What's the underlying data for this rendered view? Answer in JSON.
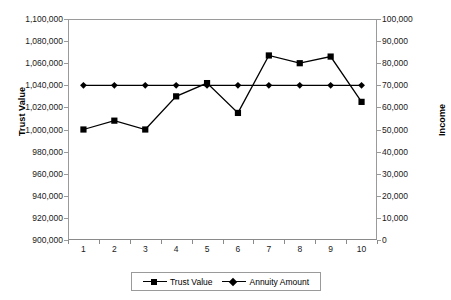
{
  "chart_data": {
    "type": "line",
    "title": "",
    "xlabel": "",
    "ylabel": "Trust Value",
    "y2label": "Income",
    "categories": [
      "1",
      "2",
      "3",
      "4",
      "5",
      "6",
      "7",
      "8",
      "9",
      "10"
    ],
    "ylim": [
      900000,
      1100000
    ],
    "ytick_step": 20000,
    "yticks": [
      "900,000",
      "920,000",
      "940,000",
      "960,000",
      "980,000",
      "1,000,000",
      "1,020,000",
      "1,040,000",
      "1,060,000",
      "1,080,000",
      "1,100,000"
    ],
    "y2lim": [
      0,
      100000
    ],
    "y2tick_step": 10000,
    "y2ticks": [
      "0",
      "10,000",
      "20,000",
      "30,000",
      "40,000",
      "50,000",
      "60,000",
      "70,000",
      "80,000",
      "90,000",
      "100,000"
    ],
    "grid": false,
    "legend_position": "bottom",
    "series": [
      {
        "name": "Trust Value",
        "axis": "left",
        "marker": "square",
        "color": "#000000",
        "values": [
          1000000,
          1008000,
          1000000,
          1030000,
          1042000,
          1015000,
          1067000,
          1060000,
          1066000,
          1025000
        ]
      },
      {
        "name": "Annuity Amount",
        "axis": "right",
        "marker": "diamond",
        "color": "#000000",
        "values": [
          70000,
          70000,
          70000,
          70000,
          70000,
          70000,
          70000,
          70000,
          70000,
          70000
        ]
      }
    ]
  },
  "legend": {
    "entries": [
      {
        "label": "Trust Value",
        "marker": "square"
      },
      {
        "label": "Annuity Amount",
        "marker": "diamond"
      }
    ]
  },
  "axes": {
    "left_title": "Trust Value",
    "right_title": "Income"
  }
}
